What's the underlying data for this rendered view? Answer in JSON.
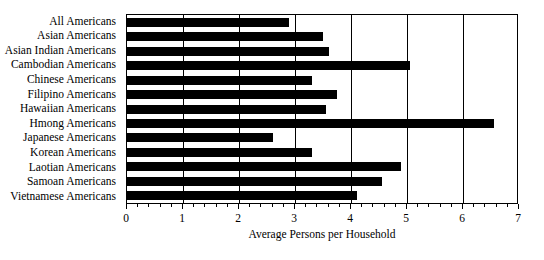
{
  "chart_data": {
    "type": "bar",
    "orientation": "horizontal",
    "title": "",
    "xlabel": "Average Persons per Household",
    "ylabel": "",
    "xlim": [
      0,
      7
    ],
    "xticks": [
      0,
      1,
      2,
      3,
      4,
      5,
      6,
      7
    ],
    "minor_tick_interval": 0.2,
    "grid": true,
    "legend": null,
    "bar_color": "#000000",
    "background_color": "#ffffff",
    "categories": [
      "All Americans",
      "Asian Americans",
      "Asian Indian Americans",
      "Cambodian Americans",
      "Chinese Americans",
      "Filipino Americans",
      "Hawaiian Americans",
      "Hmong Americans",
      "Japanese Americans",
      "Korean Americans",
      "Laotian Americans",
      "Samoan Americans",
      "Vietnamese Americans"
    ],
    "values": [
      2.9,
      3.5,
      3.6,
      5.05,
      3.3,
      3.75,
      3.55,
      6.55,
      2.6,
      3.3,
      4.9,
      4.55,
      4.1
    ]
  },
  "axis": {
    "x_tick_labels": [
      "0",
      "1",
      "2",
      "3",
      "4",
      "5",
      "6",
      "7"
    ],
    "x_axis_title": "Average Persons per Household"
  },
  "title_sliver": ""
}
